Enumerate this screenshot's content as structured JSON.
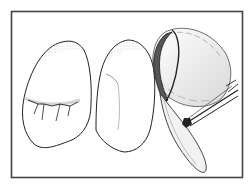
{
  "figure": {
    "elements": [
      "frame",
      "left-tooth",
      "right-tooth",
      "dental-mirror",
      "instrument-handle"
    ],
    "colors": {
      "line": "#222222",
      "frame": "#444444",
      "background": "#ffffff",
      "stipple": "#888888"
    }
  }
}
